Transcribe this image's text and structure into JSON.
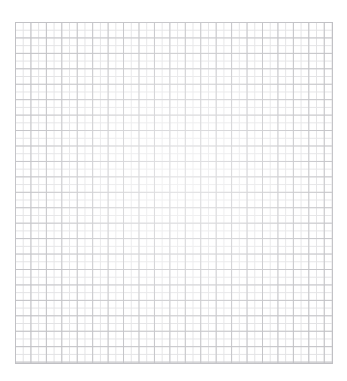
{
  "document": {
    "kind": "graph-paper-sheet",
    "title": "Blank grid paper",
    "has_text": false,
    "has_labels": false,
    "has_axes": false
  },
  "canvas": {
    "width": 347,
    "height": 381,
    "background_color": "#ffffff"
  },
  "sheet": {
    "left": 15,
    "top": 22,
    "width": 318,
    "height": 342,
    "paper_color": "#ffffff"
  },
  "grid": {
    "minor_cell_px": 7.72,
    "major_cell_px": 15.44,
    "minor_per_major": 2,
    "columns_minor": 41,
    "rows_minor": 44,
    "columns_major": 21,
    "rows_major": 22,
    "minor_line_color": "#e2e2e4",
    "major_line_color": "#c0c0c4",
    "minor_line_width_px": 1,
    "major_line_width_px": 1,
    "orientation": "square"
  }
}
